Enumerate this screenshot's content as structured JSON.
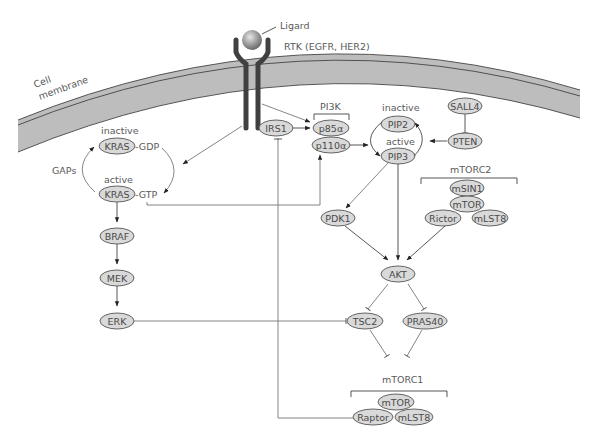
{
  "labels": {
    "ligand": "Ligard",
    "rtk": "RTK (EGFR, HER2)",
    "cell": "Cell",
    "membrane": "membrane",
    "inactive_kras": "inactive",
    "active_kras": "active",
    "gaps": "GAPs",
    "gdp": "-GDP",
    "gtp": "-GTP",
    "pi3k": "PI3K",
    "inactive_pip": "inactive",
    "active_pip": "active",
    "mtorc2": "mTORC2",
    "mtorc1": "mTORC1"
  },
  "nodes": {
    "kras_inactive": "KRAS",
    "kras_active": "KRAS",
    "braf": "BRAF",
    "mek": "MEK",
    "erk": "ERK",
    "irs1": "IRS1",
    "p85": "p85α",
    "p110": "p110α",
    "pip2": "PIP2",
    "pip3": "PIP3",
    "sall4": "SALL4",
    "pten": "PTEN",
    "msin1": "mSIN1",
    "mtor2": "mTOR",
    "rictor": "Rictor",
    "mlst8_2": "mLST8",
    "pdk1": "PDK1",
    "akt": "AKT",
    "tsc2": "TSC2",
    "pras40": "PRAS40",
    "mtor1": "mTOR",
    "raptor": "Raptor",
    "mlst8_1": "mLST8"
  },
  "colors": {
    "node_fill": "#d9d9d9",
    "membrane_fill": "#bdbdbd",
    "line": "#444444"
  }
}
